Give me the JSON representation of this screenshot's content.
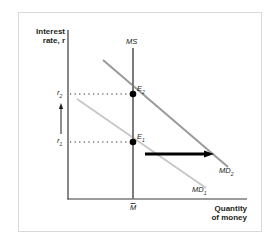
{
  "diagram": {
    "type": "money-market",
    "y_axis_label_line1": "Interest",
    "y_axis_label_line2": "rate, r",
    "x_axis_label_line1": "Quantity",
    "x_axis_label_line2": "of money",
    "supply_curve_label": "MS",
    "fixed_money_label": "M̄",
    "demand_curves": [
      {
        "label": "MD1",
        "display": "MD",
        "sub": "1",
        "color": "#c8c8c8"
      },
      {
        "label": "MD2",
        "display": "MD",
        "sub": "2",
        "color": "#9a9a9a"
      }
    ],
    "equilibria": [
      {
        "label": "E1",
        "display": "E",
        "sub": "1"
      },
      {
        "label": "E2",
        "display": "E",
        "sub": "2"
      }
    ],
    "rates": [
      {
        "label": "r1",
        "display": "r",
        "sub": "1"
      },
      {
        "label": "r2",
        "display": "r",
        "sub": "2"
      }
    ],
    "annotations": {
      "demand_shift": "rightward shift of money demand from MD1 to MD2",
      "rate_change": "interest rate rises from r1 to r2"
    },
    "colors": {
      "axis": "#3a3a3a",
      "supply": "#7a7a7a",
      "frame": "#d9d9d9",
      "arrow": "#000000",
      "point": "#000000"
    }
  }
}
